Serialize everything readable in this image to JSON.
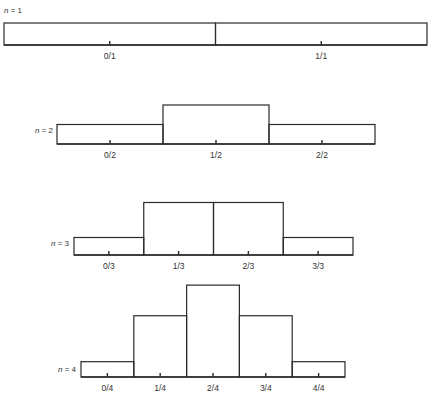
{
  "chart_data": [
    {
      "type": "bar",
      "label_var": "n",
      "n": 1,
      "label_text": "= 1",
      "categories": [
        "0/1",
        "1/1"
      ],
      "probabilities": [
        0.5,
        0.5
      ],
      "coefficients": [
        1,
        1
      ]
    },
    {
      "type": "bar",
      "label_var": "n",
      "n": 2,
      "label_text": "= 2",
      "categories": [
        "0/2",
        "1/2",
        "2/2"
      ],
      "probabilities": [
        0.25,
        0.5,
        0.25
      ],
      "coefficients": [
        1,
        2,
        1
      ]
    },
    {
      "type": "bar",
      "label_var": "n",
      "n": 3,
      "label_text": "= 3",
      "categories": [
        "0/3",
        "1/3",
        "2/3",
        "3/3"
      ],
      "probabilities": [
        0.125,
        0.375,
        0.375,
        0.125
      ],
      "coefficients": [
        1,
        3,
        3,
        1
      ]
    },
    {
      "type": "bar",
      "label_var": "n",
      "n": 4,
      "label_text": "= 4",
      "categories": [
        "0/4",
        "1/4",
        "2/4",
        "3/4",
        "4/4"
      ],
      "probabilities": [
        0.0625,
        0.25,
        0.375,
        0.25,
        0.0625
      ],
      "coefficients": [
        1,
        4,
        6,
        4,
        1
      ]
    }
  ]
}
